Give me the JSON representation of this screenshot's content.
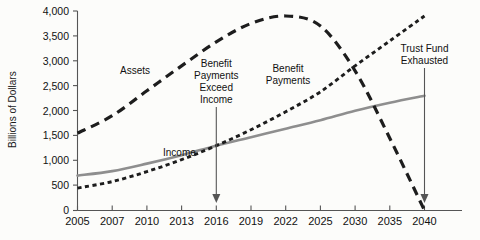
{
  "chart_data": {
    "type": "line",
    "title": "",
    "xlabel": "",
    "ylabel": "Billions of Dollars",
    "xlim": [
      2005,
      2040
    ],
    "ylim": [
      0,
      4000
    ],
    "grid": false,
    "legend_position": "inline-labels",
    "y_ticks": [
      "0",
      "500",
      "1,000",
      "1,500",
      "2,000",
      "2,500",
      "3,000",
      "3,500",
      "4,000"
    ],
    "y_tick_values": [
      0,
      500,
      1000,
      1500,
      2000,
      2500,
      3000,
      3500,
      4000
    ],
    "x_ticks": [
      "2005",
      "2007",
      "2010",
      "2013",
      "2016",
      "2019",
      "2022",
      "2025",
      "2030",
      "2035",
      "2040"
    ],
    "x_tick_values": [
      2005,
      2007,
      2010,
      2013,
      2016,
      2019,
      2022,
      2025,
      2030,
      2035,
      2040
    ],
    "series": [
      {
        "name": "Assets",
        "style": "long-dashed",
        "color": "#1d1d1d",
        "x": [
          2005,
          2007,
          2010,
          2013,
          2016,
          2019,
          2022,
          2025,
          2030,
          2035,
          2040
        ],
        "values": [
          1550,
          1900,
          2400,
          2900,
          3380,
          3750,
          3900,
          3700,
          2800,
          1450,
          0
        ]
      },
      {
        "name": "Benefit Payments",
        "style": "short-dashed",
        "color": "#1d1d1d",
        "x": [
          2005,
          2007,
          2010,
          2013,
          2016,
          2019,
          2022,
          2025,
          2030,
          2035,
          2040
        ],
        "values": [
          450,
          580,
          780,
          1020,
          1300,
          1620,
          1980,
          2380,
          2900,
          3400,
          3900
        ]
      },
      {
        "name": "Income",
        "style": "solid",
        "color": "#8e8e8e",
        "x": [
          2005,
          2007,
          2010,
          2013,
          2016,
          2019,
          2022,
          2025,
          2030,
          2035,
          2040
        ],
        "values": [
          700,
          790,
          940,
          1110,
          1300,
          1470,
          1640,
          1810,
          2000,
          2160,
          2300
        ]
      }
    ],
    "annotations": [
      {
        "id": "assets-label",
        "text": "Assets",
        "lines": [
          "Assets"
        ],
        "at_x": 2009,
        "at_y": 2950
      },
      {
        "id": "benefit-payments-exceed-income-label",
        "text": "Benefit Payments Exceed Income",
        "lines": [
          "Benefit",
          "Payments",
          "Exceed",
          "Income"
        ],
        "at_x": 2016,
        "at_y": 2700,
        "pointer_to_x": 2016,
        "pointer_to_y": 0
      },
      {
        "id": "benefit-payments-label",
        "text": "Benefit Payments",
        "lines": [
          "Benefit",
          "Payments"
        ],
        "at_x": 2022,
        "at_y": 2650
      },
      {
        "id": "income-label",
        "text": "Income",
        "lines": [
          "Income"
        ],
        "at_x": 2012,
        "at_y": 1450
      },
      {
        "id": "trust-fund-exhausted-label",
        "text": "Trust Fund Exhausted",
        "lines": [
          "Trust Fund",
          "Exhausted"
        ],
        "at_x": 2040,
        "at_y": 2800,
        "pointer_to_x": 2040,
        "pointer_to_y": 0
      }
    ]
  },
  "axis": {
    "y_label": "Billions of Dollars",
    "y_tick_labels": [
      "4,000",
      "3,500",
      "3,000",
      "2,500",
      "2,000",
      "1,500",
      "1,000",
      "500",
      "0"
    ],
    "x_tick_labels": [
      "2005",
      "2007",
      "2010",
      "2013",
      "2016",
      "2019",
      "2022",
      "2025",
      "2030",
      "2035",
      "2040"
    ]
  },
  "labels": {
    "assets": "Assets",
    "income": "Income",
    "benefit_payments_1": "Benefit",
    "benefit_payments_2": "Payments",
    "exceed_1": "Benefit",
    "exceed_2": "Payments",
    "exceed_3": "Exceed",
    "exceed_4": "Income",
    "trust_1": "Trust Fund",
    "trust_2": "Exhausted"
  },
  "colors": {
    "assets": "#1d1d1d",
    "benefits": "#1d1d1d",
    "income": "#8e8e8e",
    "axis": "#555555",
    "background": "#fcfcfa"
  }
}
